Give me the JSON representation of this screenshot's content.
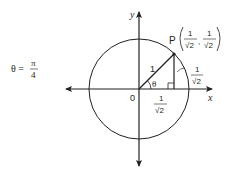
{
  "diagram": {
    "type": "unit-circle",
    "angle_label": {
      "lhs": "θ =",
      "numerator": "π",
      "denominator": "4"
    },
    "axes": {
      "x_label": "x",
      "y_label": "y",
      "origin_label": "0"
    },
    "radius_label": "1",
    "theta_label": "θ",
    "point": {
      "name": "P",
      "x_num": "1",
      "x_den": "√2",
      "y_num": "1",
      "y_den": "√2",
      "comma": ","
    },
    "vertical_side": {
      "num": "1",
      "den": "√2"
    },
    "horizontal_side": {
      "num": "1",
      "den": "√2"
    },
    "colors": {
      "stroke": "#231f20",
      "background": "#ffffff"
    }
  }
}
